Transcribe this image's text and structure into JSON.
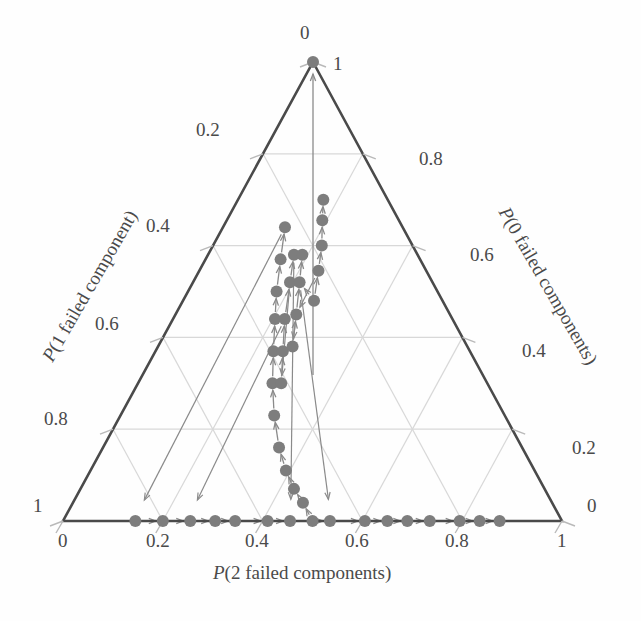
{
  "chart_data": {
    "type": "scatter",
    "plot_kind": "ternary-trajectory",
    "title": "",
    "axes": {
      "bottom": {
        "label": "P(2 failed components)",
        "label_prefix_italic": "P",
        "ticks": [
          "0",
          "0.2",
          "0.4",
          "0.6",
          "0.8",
          "1"
        ],
        "range": [
          0,
          1
        ],
        "direction": "left-to-right"
      },
      "left": {
        "label": "P(1 failed component)",
        "label_prefix_italic": "P",
        "ticks": [
          "0",
          "0.2",
          "0.4",
          "0.6",
          "0.8",
          "1"
        ],
        "range": [
          0,
          1
        ],
        "direction": "top-to-bottom"
      },
      "right": {
        "label": "P(0 failed components)",
        "label_prefix_italic": "P",
        "ticks": [
          "1",
          "0.8",
          "0.6",
          "0.4",
          "0.2",
          "0"
        ],
        "range": [
          0,
          1
        ],
        "direction": "top-to-bottom"
      }
    },
    "grid": true,
    "grid_step": 0.2,
    "legend": null,
    "marker_color": "#7d7d7d",
    "arrow_color": "#8a8a8a",
    "axis_color": "#4a4a4a",
    "grid_color": "#d8d8d8",
    "marker_radius_px": 6,
    "trajectories": [
      {
        "name": "upper-left-edge-to-apex",
        "comment": "points hugging the left edge converging to the apex (1,0,0) at top",
        "points_barycentric": [
          [
            0.5,
            0.0,
            0.5
          ],
          [
            0.48,
            0.04,
            0.48
          ],
          [
            0.46,
            0.07,
            0.47
          ],
          [
            0.44,
            0.11,
            0.45
          ],
          [
            0.42,
            0.16,
            0.42
          ],
          [
            0.4,
            0.23,
            0.37
          ],
          [
            0.385,
            0.3,
            0.315
          ],
          [
            0.375,
            0.37,
            0.255
          ],
          [
            0.365,
            0.44,
            0.195
          ],
          [
            0.355,
            0.5,
            0.145
          ],
          [
            0.35,
            0.57,
            0.08
          ],
          [
            0.345,
            0.64,
            0.015
          ]
        ]
      },
      {
        "name": "inner-left-chain",
        "points_barycentric": [
          [
            0.41,
            0.3,
            0.29
          ],
          [
            0.405,
            0.37,
            0.225
          ],
          [
            0.4,
            0.44,
            0.16
          ],
          [
            0.405,
            0.52,
            0.075
          ],
          [
            0.41,
            0.58,
            0.01
          ]
        ]
      },
      {
        "name": "inner-right-chain",
        "points_barycentric": [
          [
            0.435,
            0.38,
            0.185
          ],
          [
            0.44,
            0.45,
            0.11
          ],
          [
            0.445,
            0.52,
            0.035
          ],
          [
            0.45,
            0.58,
            -0.03
          ]
        ]
      },
      {
        "name": "right-descending-chain",
        "points_barycentric": [
          [
            0.505,
            0.48,
            0.015
          ],
          [
            0.525,
            0.545,
            -0.07
          ],
          [
            0.545,
            0.6,
            -0.145
          ],
          [
            0.555,
            0.655,
            -0.21
          ],
          [
            0.57,
            0.7,
            -0.27
          ]
        ]
      }
    ],
    "bottom_axis_points_p2": [
      0.145,
      0.2,
      0.255,
      0.305,
      0.345,
      0.41,
      0.455,
      0.535,
      0.605,
      0.65,
      0.69,
      0.735,
      0.795,
      0.835,
      0.875
    ],
    "annotations": {
      "apex_value": "1",
      "apex_top_label": "0"
    }
  },
  "labels": {
    "bottom_axis_title": "P(2 failed components)",
    "left_axis_title": "P(1 failed component)",
    "right_axis_title": "P(0 failed components)",
    "bottom_ticks": [
      "0",
      "0.2",
      "0.4",
      "0.6",
      "0.8",
      "1"
    ],
    "left_ticks": [
      "0",
      "0.2",
      "0.4",
      "0.6",
      "0.8",
      "1"
    ],
    "right_ticks": [
      "1",
      "0.8",
      "0.6",
      "0.4",
      "0.2",
      "0"
    ]
  }
}
